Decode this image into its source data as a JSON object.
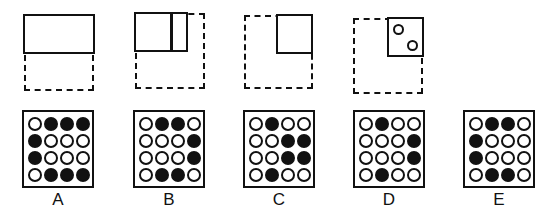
{
  "question_figures": [
    {
      "id": "fig1",
      "description": "solid top half rectangle with dashed lower half"
    },
    {
      "id": "fig2",
      "description": "solid rect with vertical divider, dashed full square"
    },
    {
      "id": "fig3",
      "description": "solid top-right quarter square, dashed full square"
    },
    {
      "id": "fig4",
      "description": "solid top-right quarter with two small circles, dashed full square"
    }
  ],
  "options": [
    {
      "label": "A",
      "grid": [
        [
          0,
          1,
          1,
          1
        ],
        [
          1,
          0,
          0,
          0
        ],
        [
          1,
          0,
          0,
          0
        ],
        [
          0,
          1,
          1,
          1
        ]
      ]
    },
    {
      "label": "B",
      "grid": [
        [
          0,
          1,
          1,
          0
        ],
        [
          0,
          0,
          0,
          1
        ],
        [
          0,
          0,
          0,
          1
        ],
        [
          0,
          1,
          1,
          0
        ]
      ]
    },
    {
      "label": "C",
      "grid": [
        [
          0,
          1,
          0,
          0
        ],
        [
          0,
          0,
          1,
          1
        ],
        [
          0,
          0,
          1,
          1
        ],
        [
          0,
          1,
          0,
          0
        ]
      ]
    },
    {
      "label": "D",
      "grid": [
        [
          0,
          1,
          0,
          0
        ],
        [
          0,
          0,
          0,
          1
        ],
        [
          0,
          0,
          0,
          1
        ],
        [
          0,
          1,
          0,
          0
        ]
      ]
    },
    {
      "label": "E",
      "grid": [
        [
          0,
          1,
          1,
          0
        ],
        [
          1,
          0,
          0,
          0
        ],
        [
          1,
          0,
          0,
          0
        ],
        [
          0,
          1,
          1,
          0
        ]
      ]
    }
  ],
  "colors": {
    "ink": "#111111",
    "background": "#ffffff"
  }
}
